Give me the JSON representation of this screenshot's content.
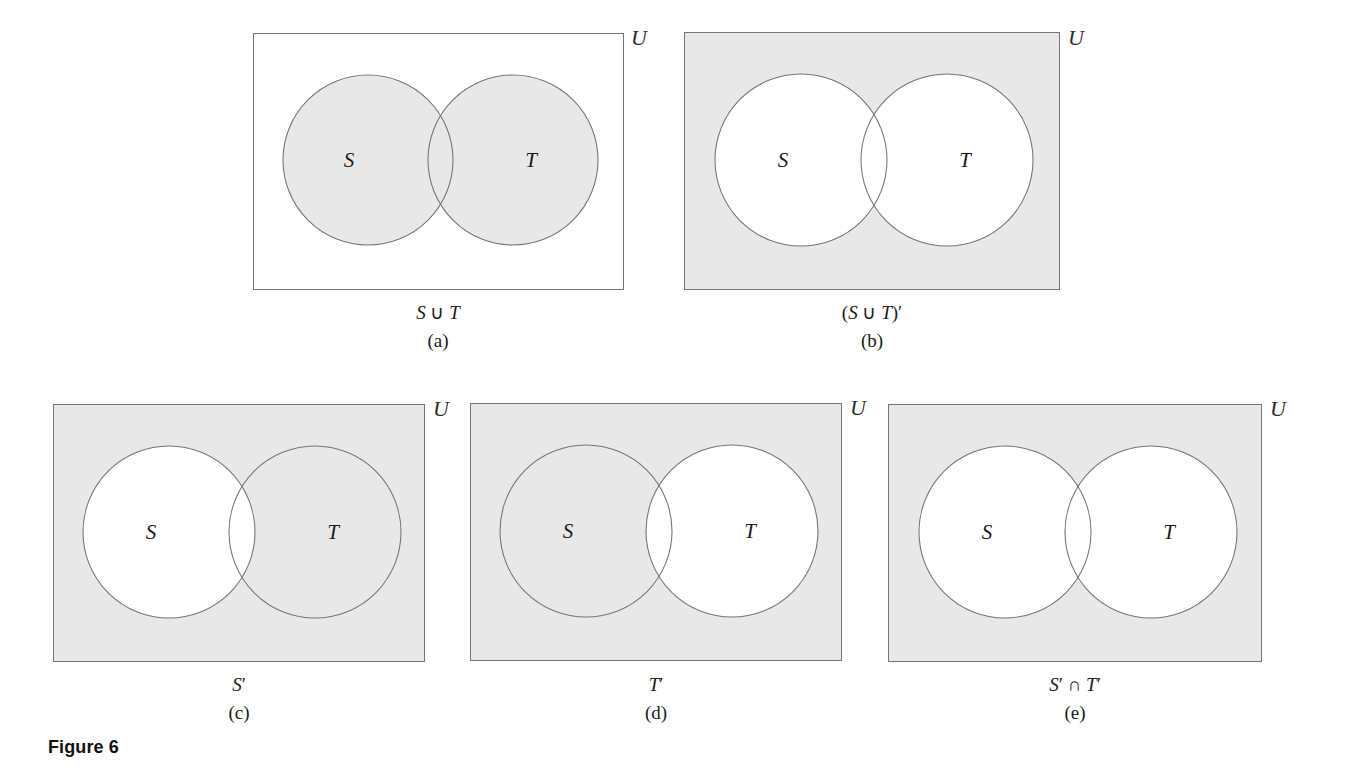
{
  "figure": {
    "title": "Figure 6",
    "universe_label": "U",
    "set_labels": {
      "s": "S",
      "t": "T"
    },
    "colors": {
      "shade": "#e8e8e8",
      "stroke": "#767676",
      "text": "#1a1a1a",
      "background": "#ffffff"
    }
  },
  "panels": [
    {
      "tag": "(a)",
      "expression_plain": "S ∪ T",
      "expression_parts": {
        "pre": "",
        "left": "S",
        "op": " ∪ ",
        "right": "T",
        "post": ""
      },
      "universe_label": "U",
      "label_s": "S",
      "label_t": "T",
      "rect_shaded": false,
      "circle_s_shaded": true,
      "circle_t_shaded": true,
      "intersection_shaded": true,
      "region_description": "union of S and T shaded"
    },
    {
      "tag": "(b)",
      "expression_plain": "(S ∪ T)′",
      "expression_parts": {
        "pre": "(",
        "left": "S",
        "op": " ∪ ",
        "right": "T",
        "post": ")′"
      },
      "universe_label": "U",
      "label_s": "S",
      "label_t": "T",
      "rect_shaded": true,
      "circle_s_shaded": false,
      "circle_t_shaded": false,
      "intersection_shaded": false,
      "region_description": "outside both circles shaded"
    },
    {
      "tag": "(c)",
      "expression_plain": "S′",
      "expression_parts": {
        "pre": "",
        "left": "S",
        "op": "",
        "right": "",
        "post": "′"
      },
      "universe_label": "U",
      "label_s": "S",
      "label_t": "T",
      "rect_shaded": true,
      "circle_s_shaded": false,
      "circle_t_shaded": true,
      "intersection_shaded": false,
      "region_description": "everything except circle S shaded"
    },
    {
      "tag": "(d)",
      "expression_plain": "T′",
      "expression_parts": {
        "pre": "",
        "left": "T",
        "op": "",
        "right": "",
        "post": "′"
      },
      "universe_label": "U",
      "label_s": "S",
      "label_t": "T",
      "rect_shaded": true,
      "circle_s_shaded": true,
      "circle_t_shaded": false,
      "intersection_shaded": false,
      "region_description": "everything except circle T shaded"
    },
    {
      "tag": "(e)",
      "expression_plain": "S′ ∩ T′",
      "expression_parts": {
        "pre": "",
        "left": "S",
        "op": "′ ∩ ",
        "right": "T",
        "post": "′"
      },
      "universe_label": "U",
      "label_s": "S",
      "label_t": "T",
      "rect_shaded": true,
      "circle_s_shaded": false,
      "circle_t_shaded": false,
      "intersection_shaded": false,
      "region_description": "outside both circles shaded"
    }
  ]
}
